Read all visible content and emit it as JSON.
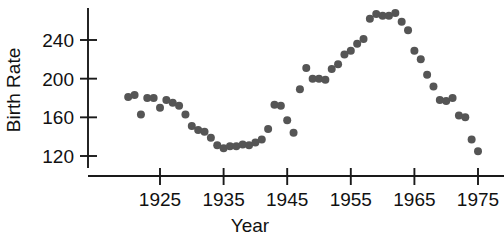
{
  "chart_data": {
    "type": "scatter",
    "title": "",
    "xlabel": "Year",
    "ylabel": "Birth Rate",
    "xlim": [
      1918,
      1977
    ],
    "ylim": [
      112,
      276
    ],
    "grid": false,
    "legend": null,
    "marker": {
      "shape": "circle",
      "color": "#555555",
      "radius_px": 4.0
    },
    "xticks": [
      1925,
      1935,
      1945,
      1955,
      1965,
      1975
    ],
    "xtick_labels": [
      "1925",
      "1935",
      "1945",
      "1955",
      "1965",
      "1975"
    ],
    "yticks": [
      120,
      160,
      200,
      240
    ],
    "ytick_labels": [
      "120",
      "160",
      "200",
      "240"
    ],
    "x": [
      1920,
      1921,
      1922,
      1923,
      1924,
      1925,
      1926,
      1927,
      1928,
      1929,
      1930,
      1931,
      1932,
      1933,
      1934,
      1935,
      1936,
      1937,
      1938,
      1939,
      1940,
      1941,
      1942,
      1943,
      1944,
      1945,
      1946,
      1947,
      1948,
      1949,
      1950,
      1951,
      1952,
      1953,
      1954,
      1955,
      1956,
      1957,
      1958,
      1959,
      1960,
      1961,
      1962,
      1963,
      1964,
      1965,
      1966,
      1967,
      1968,
      1969,
      1970,
      1971,
      1972,
      1973,
      1974,
      1975
    ],
    "y": [
      181,
      183,
      163,
      180,
      180,
      170,
      178,
      175,
      172,
      163,
      151,
      147,
      145,
      139,
      131,
      128,
      130,
      130,
      132,
      131,
      134,
      137,
      148,
      173,
      172,
      157,
      144,
      189,
      211,
      200,
      200,
      199,
      210,
      215,
      225,
      229,
      236,
      241,
      262,
      267,
      265,
      265,
      268,
      259,
      250,
      229,
      220,
      204,
      192,
      178,
      177,
      180,
      162,
      160,
      137,
      125
    ],
    "series_name": "Birth Rate"
  }
}
